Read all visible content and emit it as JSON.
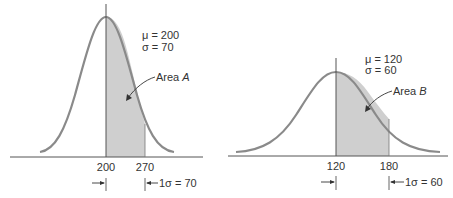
{
  "left": {
    "mu_label": "μ = 200",
    "sigma_label": "σ =   70",
    "area_label_prefix": "Area ",
    "area_label_letter": "A",
    "tick_mean": "200",
    "tick_sigma": "270",
    "sigma_width_label": "1σ = 70"
  },
  "right": {
    "mu_label": "μ = 120",
    "sigma_label": "σ =   60",
    "area_label_prefix": "Area ",
    "area_label_letter": "B",
    "tick_mean": "120",
    "tick_sigma": "180",
    "sigma_width_label": "1σ = 60"
  },
  "colors": {
    "curve": "#8a8a8a",
    "shade": "#cfcfcf",
    "axis": "#555555",
    "text": "#333333"
  }
}
